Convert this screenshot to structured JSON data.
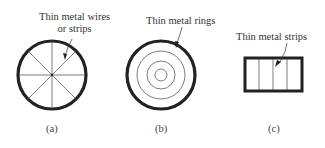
{
  "figures": [
    {
      "id": "a",
      "caption": "(a)",
      "label_line1": "Thin metal wires",
      "label_line2": "or strips",
      "shape": "circle",
      "description": "Circle with 8 radial wires from center"
    },
    {
      "id": "b",
      "caption": "(b)",
      "label_line1": "Thin metal rings",
      "shape": "circle",
      "description": "Circle with 3 concentric inner rings"
    },
    {
      "id": "c",
      "caption": "(c)",
      "label_line1": "Thin metal strips",
      "shape": "rectangle",
      "description": "Rectangle with 3 vertical strips"
    }
  ],
  "colors": {
    "stroke": "#222222",
    "text": "#333333"
  }
}
